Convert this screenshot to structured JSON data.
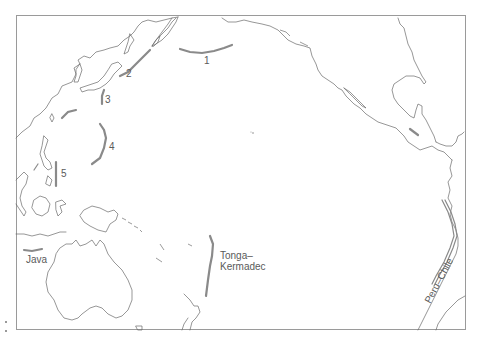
{
  "map": {
    "title": "",
    "region": "Pacific Ocean",
    "feature_type": "ocean trenches",
    "colors": {
      "coastline": "#6a6a6a",
      "trench": "#8a8a8a",
      "frame": "#9a9a9a",
      "label": "#5a5a5a",
      "background": "#ffffff"
    },
    "labels": [
      {
        "id": "1",
        "text": "1"
      },
      {
        "id": "2",
        "text": "2"
      },
      {
        "id": "3",
        "text": "3"
      },
      {
        "id": "4",
        "text": "4"
      },
      {
        "id": "5",
        "text": "5"
      },
      {
        "id": "java",
        "text": "Java"
      },
      {
        "id": "tonga_line1",
        "text": "Tonga–"
      },
      {
        "id": "tonga_line2",
        "text": "Kermadec"
      },
      {
        "id": "peru_chile",
        "text": "Peru–Chile"
      }
    ],
    "trenches": [
      {
        "label": "1",
        "name": "Aleutian"
      },
      {
        "label": "2",
        "name": "Kuril–Kamchatka"
      },
      {
        "label": "3",
        "name": "Japan / Izu–Bonin"
      },
      {
        "label": "4",
        "name": "Mariana"
      },
      {
        "label": "5",
        "name": "Philippine"
      },
      {
        "label": "Java",
        "name": "Java"
      },
      {
        "label": "Tonga–Kermadec",
        "name": "Tonga–Kermadec"
      },
      {
        "label": "Peru–Chile",
        "name": "Peru–Chile"
      }
    ]
  }
}
